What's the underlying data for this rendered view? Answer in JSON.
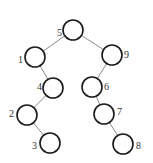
{
  "diagram": {
    "type": "binary-search-tree",
    "node_radius": 10,
    "nodes": [
      {
        "id": "5",
        "label": "5",
        "cx": 73,
        "cy": 30,
        "lx": 57,
        "ly": 36
      },
      {
        "id": "1",
        "label": "1",
        "cx": 35,
        "cy": 57,
        "lx": 18,
        "ly": 63
      },
      {
        "id": "9",
        "label": "9",
        "cx": 112,
        "cy": 55,
        "lx": 124,
        "ly": 58
      },
      {
        "id": "4",
        "label": "4",
        "cx": 53,
        "cy": 88,
        "lx": 37,
        "ly": 90
      },
      {
        "id": "6",
        "label": "6",
        "cx": 92,
        "cy": 87,
        "lx": 104,
        "ly": 90
      },
      {
        "id": "2",
        "label": "2",
        "cx": 27,
        "cy": 115,
        "lx": 9,
        "ly": 117
      },
      {
        "id": "7",
        "label": "7",
        "cx": 104,
        "cy": 114,
        "lx": 117,
        "ly": 115
      },
      {
        "id": "3",
        "label": "3",
        "cx": 50,
        "cy": 143,
        "lx": 32,
        "ly": 149
      },
      {
        "id": "8",
        "label": "8",
        "cx": 123,
        "cy": 144,
        "lx": 136,
        "ly": 149
      }
    ],
    "edges": [
      {
        "from": "5",
        "to": "1"
      },
      {
        "from": "5",
        "to": "9"
      },
      {
        "from": "1",
        "to": "4"
      },
      {
        "from": "9",
        "to": "6"
      },
      {
        "from": "4",
        "to": "2"
      },
      {
        "from": "6",
        "to": "7"
      },
      {
        "from": "2",
        "to": "3"
      },
      {
        "from": "7",
        "to": "8"
      }
    ]
  }
}
